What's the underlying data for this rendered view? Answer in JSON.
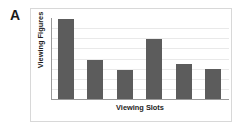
{
  "panel": {
    "label": "A"
  },
  "colors": {
    "bar": "#5c5c5c",
    "axis": "#9a9a9a",
    "gridline": "#e9e9e9",
    "card_border": "#d8d8d8",
    "text": "#1d1d1d",
    "background": "#ffffff"
  },
  "chart_data": {
    "type": "bar",
    "title": "",
    "subtitle": "",
    "panel_label": "A",
    "xlabel": "Viewing Slots",
    "ylabel": "Viewing Figures",
    "categories": [
      "1",
      "2",
      "3",
      "4",
      "5",
      "6"
    ],
    "values": [
      7.9,
      3.9,
      2.9,
      5.9,
      3.5,
      3.0
    ],
    "ylim": [
      0,
      8
    ],
    "xlim": [
      0,
      6
    ],
    "ytick_labels": [],
    "xtick_labels": [],
    "gridlines": {
      "horizontal": true,
      "vertical": false,
      "count": 7,
      "values": [
        1,
        2,
        3,
        4,
        5,
        6,
        7
      ]
    },
    "legend": {
      "visible": false,
      "position": "none",
      "entries": []
    },
    "series": [
      {
        "name": "Viewing Figures",
        "values": [
          7.9,
          3.9,
          2.9,
          5.9,
          3.5,
          3.0
        ]
      }
    ],
    "axis_tick_marks": false,
    "bar_color": "#5c5c5c"
  }
}
